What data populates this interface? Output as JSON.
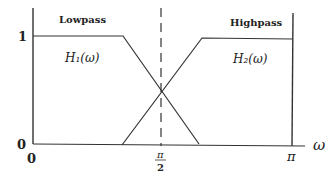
{
  "diagram": {
    "labels": {
      "lowpass": "Lowpass",
      "highpass": "Highpass",
      "h1": "H₁(ω)",
      "h2": "H₂(ω)",
      "x_axis_symbol": "ω"
    },
    "y_ticks": {
      "one": "1",
      "zero": "0"
    },
    "x_ticks": {
      "zero": "0",
      "half_pi_num": "π",
      "half_pi_den": "2",
      "pi": "π"
    },
    "colors": {
      "line": "#333333",
      "text": "#222222"
    }
  }
}
